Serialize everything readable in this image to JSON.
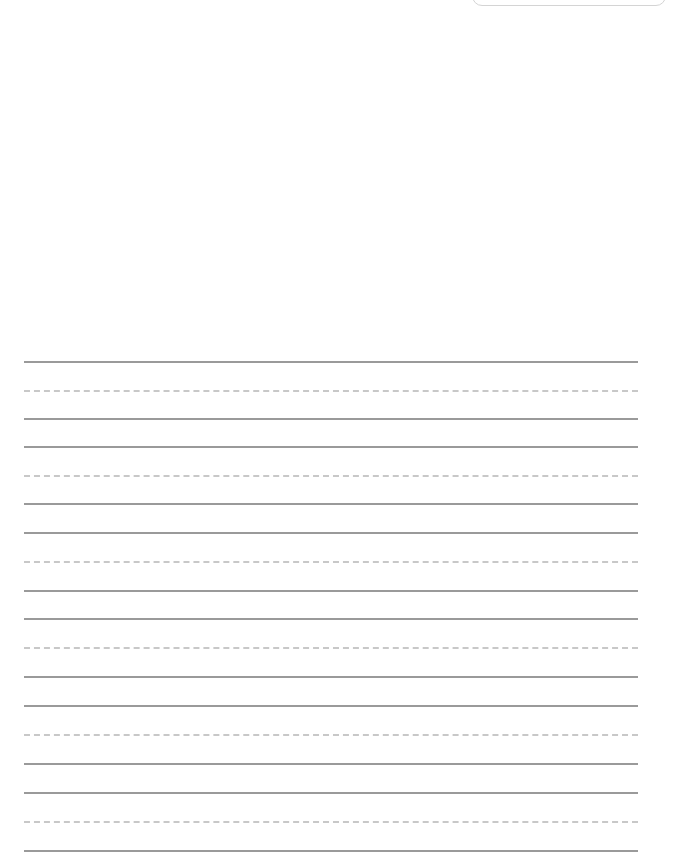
{
  "page": {
    "type": "handwriting-practice-sheet",
    "header_box": {
      "label": ""
    },
    "guide_colors": {
      "solid": "#9a9a9a",
      "dashed": "#c8c8c8"
    },
    "line_groups": [
      {
        "top": 361,
        "mid": 390,
        "bottom": 418
      },
      {
        "top": 446,
        "mid": 475,
        "bottom": 503
      },
      {
        "top": 532,
        "mid": 561,
        "bottom": 590
      },
      {
        "top": 618,
        "mid": 647,
        "bottom": 676
      },
      {
        "top": 705,
        "mid": 734,
        "bottom": 763
      },
      {
        "top": 792,
        "mid": 821,
        "bottom": 850
      }
    ]
  }
}
